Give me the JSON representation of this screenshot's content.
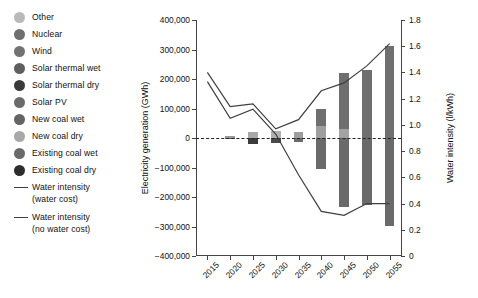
{
  "legend": {
    "items": [
      {
        "label": "Other",
        "color": "#b9b9b9",
        "type": "swatch"
      },
      {
        "label": "Nuclear",
        "color": "#6e6e6e",
        "type": "swatch"
      },
      {
        "label": "Wind",
        "color": "#727272",
        "type": "swatch"
      },
      {
        "label": "Solar thermal wet",
        "color": "#5f5f5f",
        "type": "swatch"
      },
      {
        "label": "Solar thermal dry",
        "color": "#3a3a3a",
        "type": "swatch"
      },
      {
        "label": "Solar PV",
        "color": "#6b6b6b",
        "type": "swatch"
      },
      {
        "label": "New coal wet",
        "color": "#646464",
        "type": "swatch"
      },
      {
        "label": "New coal dry",
        "color": "#a8a8a8",
        "type": "swatch"
      },
      {
        "label": "Existing coal wet",
        "color": "#6a6a6a",
        "type": "swatch"
      },
      {
        "label": "Existing coal dry",
        "color": "#2e2e2e",
        "type": "swatch"
      },
      {
        "label": "Water intensity (water cost)",
        "color": "#3f3f3f",
        "type": "line"
      },
      {
        "label": "Water intensity (no water cost)",
        "color": "#3f3f3f",
        "type": "line"
      }
    ]
  },
  "chart_data": {
    "type": "bar",
    "title": "",
    "xlabel": "",
    "ylabel": "Electricity generation (GWh)",
    "y2label": "Water intensity (l/kWh)",
    "categories": [
      "2015",
      "2020",
      "2025",
      "2030",
      "2035",
      "2040",
      "2045",
      "2050",
      "2055"
    ],
    "ylim": [
      -400000,
      400000
    ],
    "yticks": [
      "400,000",
      "300,000",
      "200,000",
      "100,000",
      "0",
      "-100,000",
      "-200,000",
      "-300,000",
      "-400,000"
    ],
    "ytick_values": [
      400000,
      300000,
      200000,
      100000,
      0,
      -100000,
      -200000,
      -300000,
      -400000
    ],
    "y2lim": [
      0,
      1.8
    ],
    "y2ticks": [
      "1.8",
      "1.6",
      "1.4",
      "1.2",
      "1.0",
      "0.8",
      "0.6",
      "0.4",
      "0.2",
      "0"
    ],
    "y2tick_values": [
      1.8,
      1.6,
      1.4,
      1.2,
      1.0,
      0.8,
      0.6,
      0.4,
      0.2,
      0
    ],
    "grid": false,
    "legend_position": "left-outside",
    "zero_reference_line": true,
    "bars": [
      {
        "x": "2015",
        "positive": [],
        "negative": []
      },
      {
        "x": "2020",
        "positive": [
          {
            "name": "Other",
            "value": 6000,
            "color": "#9a9a9a"
          }
        ],
        "negative": [
          {
            "name": "Existing coal wet",
            "value": -4000,
            "color": "#6a6a6a"
          }
        ]
      },
      {
        "x": "2025",
        "positive": [
          {
            "name": "New coal dry",
            "value": 22000,
            "color": "#a8a8a8"
          }
        ],
        "negative": [
          {
            "name": "Existing coal dry",
            "value": -20000,
            "color": "#3b3b3b"
          }
        ]
      },
      {
        "x": "2030",
        "positive": [
          {
            "name": "New coal dry",
            "value": 25000,
            "color": "#b0b0b0"
          }
        ],
        "negative": [
          {
            "name": "Existing coal dry",
            "value": -18000,
            "color": "#4a4a4a"
          }
        ]
      },
      {
        "x": "2035",
        "positive": [
          {
            "name": "Solar PV",
            "value": 20000,
            "color": "#9d9d9d"
          }
        ],
        "negative": [
          {
            "name": "Existing coal wet",
            "value": -14000,
            "color": "#6a6a6a"
          }
        ]
      },
      {
        "x": "2040",
        "positive": [
          {
            "name": "Solar PV",
            "value": 40000,
            "color": "#9f9f9f"
          },
          {
            "name": "Wind",
            "value": 60000,
            "color": "#6f6f6f"
          }
        ],
        "negative": [
          {
            "name": "Existing coal",
            "value": -105000,
            "color": "#6a6a6a"
          }
        ]
      },
      {
        "x": "2045",
        "positive": [
          {
            "name": "Solar PV",
            "value": 30000,
            "color": "#a2a2a2"
          },
          {
            "name": "Wind",
            "value": 190000,
            "color": "#6f6f6f"
          }
        ],
        "negative": [
          {
            "name": "Existing coal",
            "value": -235000,
            "color": "#6a6a6a"
          }
        ]
      },
      {
        "x": "2050",
        "positive": [
          {
            "name": "Wind",
            "value": 232000,
            "color": "#6f6f6f"
          }
        ],
        "negative": [
          {
            "name": "Existing coal",
            "value": -228000,
            "color": "#6a6a6a"
          }
        ]
      },
      {
        "x": "2055",
        "positive": [
          {
            "name": "Wind",
            "value": 312000,
            "color": "#6f6f6f"
          }
        ],
        "negative": [
          {
            "name": "Existing coal",
            "value": -298000,
            "color": "#6a6a6a"
          }
        ]
      }
    ],
    "series": [
      {
        "name": "Water intensity (water cost)",
        "axis": "y2",
        "color": "#3f3f3f",
        "x": [
          "2015",
          "2020",
          "2025",
          "2030",
          "2035",
          "2040",
          "2045",
          "2050",
          "2055"
        ],
        "values": [
          1.4,
          1.14,
          1.16,
          0.97,
          1.04,
          1.26,
          1.32,
          1.45,
          1.62
        ]
      },
      {
        "name": "Water intensity (no water cost)",
        "axis": "y2",
        "color": "#3f3f3f",
        "x": [
          "2015",
          "2020",
          "2025",
          "2030",
          "2035",
          "2040",
          "2045",
          "2050",
          "2055"
        ],
        "values": [
          1.33,
          1.05,
          1.12,
          0.93,
          0.62,
          0.34,
          0.31,
          0.4,
          0.4
        ]
      }
    ]
  }
}
